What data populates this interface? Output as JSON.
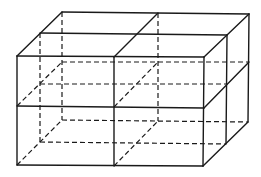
{
  "diagram": {
    "stroke_color": "#1a1a1a",
    "background": "#ffffff",
    "vertices": {
      "front_top_left": [
        17,
        56
      ],
      "front_top_mid": [
        114,
        57
      ],
      "front_top_right": [
        204,
        57
      ],
      "front_mid_left": [
        17,
        106
      ],
      "front_mid_mid": [
        114,
        107
      ],
      "front_mid_right": [
        204,
        108
      ],
      "front_bot_left": [
        17,
        165
      ],
      "front_bot_mid": [
        114,
        166
      ],
      "front_bot_right": [
        203,
        166
      ],
      "mid_top_left": [
        40,
        33
      ],
      "mid_top_mid": [
        136,
        34
      ],
      "mid_top_right": [
        227,
        35
      ],
      "mid_mid_right": [
        227,
        84
      ],
      "mid_bot_right": [
        226,
        144
      ],
      "mid_mid_left": [
        40,
        84
      ],
      "mid_bot_left": [
        40,
        142
      ],
      "back_top_left": [
        62,
        12
      ],
      "back_top_mid": [
        158,
        13
      ],
      "back_top_right": [
        249,
        14
      ],
      "back_mid_left": [
        62,
        62
      ],
      "back_mid_mid": [
        158,
        62
      ],
      "back_mid_right": [
        249,
        62
      ],
      "back_bot_left": [
        62,
        120
      ],
      "back_bot_mid": [
        158,
        121
      ],
      "back_bot_right": [
        248,
        122
      ]
    },
    "solid_lines": [
      [
        "front_top_left",
        "front_top_right"
      ],
      [
        "front_mid_left",
        "front_mid_right"
      ],
      [
        "front_bot_left",
        "front_bot_right"
      ],
      [
        "front_top_left",
        "front_bot_left"
      ],
      [
        "front_top_mid",
        "front_bot_mid"
      ],
      [
        "front_top_right",
        "front_bot_right"
      ],
      [
        "front_top_left",
        "back_top_left"
      ],
      [
        "front_top_mid",
        "back_top_mid"
      ],
      [
        "front_top_right",
        "back_top_right"
      ],
      [
        "mid_top_left",
        "mid_top_right"
      ],
      [
        "back_top_left",
        "back_top_right"
      ],
      [
        "mid_top_right",
        "mid_bot_right"
      ],
      [
        "back_top_right",
        "back_bot_right"
      ],
      [
        "front_mid_right",
        "back_mid_right"
      ],
      [
        "front_bot_right",
        "back_bot_right"
      ]
    ],
    "hidden_lines": [
      [
        "mid_top_left",
        "mid_bot_left"
      ],
      [
        "back_top_left",
        "back_bot_left"
      ],
      [
        "back_top_mid",
        "back_bot_mid"
      ],
      [
        "back_mid_left",
        "back_mid_right"
      ],
      [
        "back_bot_left",
        "back_bot_right"
      ],
      [
        "mid_mid_left",
        "mid_mid_right"
      ],
      [
        "mid_bot_left",
        "mid_bot_right"
      ],
      [
        "front_mid_left",
        "back_mid_left"
      ],
      [
        "front_bot_left",
        "back_bot_left"
      ],
      [
        "front_mid_mid",
        "back_mid_mid"
      ],
      [
        "front_bot_mid",
        "back_bot_mid"
      ]
    ]
  }
}
